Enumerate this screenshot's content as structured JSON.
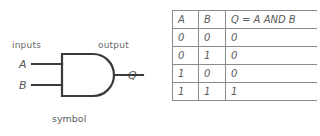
{
  "diagram": {
    "symbol_panel": {
      "caption": "symbol",
      "inputs_label": "inputs",
      "output_label": "output",
      "input_a_label": "A",
      "input_b_label": "B",
      "output_q_label": "Q",
      "gate_type": "and-gate"
    },
    "truth_table": {
      "caption": "truth table",
      "headers": [
        "A",
        "B",
        "Q = A AND B"
      ],
      "rows": [
        [
          "0",
          "0",
          "0"
        ],
        [
          "0",
          "1",
          "0"
        ],
        [
          "1",
          "0",
          "0"
        ],
        [
          "1",
          "1",
          "1"
        ]
      ]
    },
    "colors": {
      "ink": "#3a3a3a",
      "text": "#5a5a5a",
      "rule": "#8a8a8a",
      "background": "#ffffff"
    }
  }
}
